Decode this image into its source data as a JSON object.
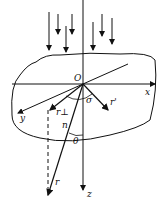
{
  "diagram": {
    "labels": {
      "origin": "O",
      "x_axis": "x",
      "y_axis": "y",
      "z_axis": "z",
      "sigma": "σ",
      "r_prime": "r'",
      "r_perp": "r⊥",
      "n": "n",
      "theta": "θ",
      "r": "r"
    },
    "colors": {
      "ink": "#111111",
      "background": "#ffffff"
    }
  }
}
